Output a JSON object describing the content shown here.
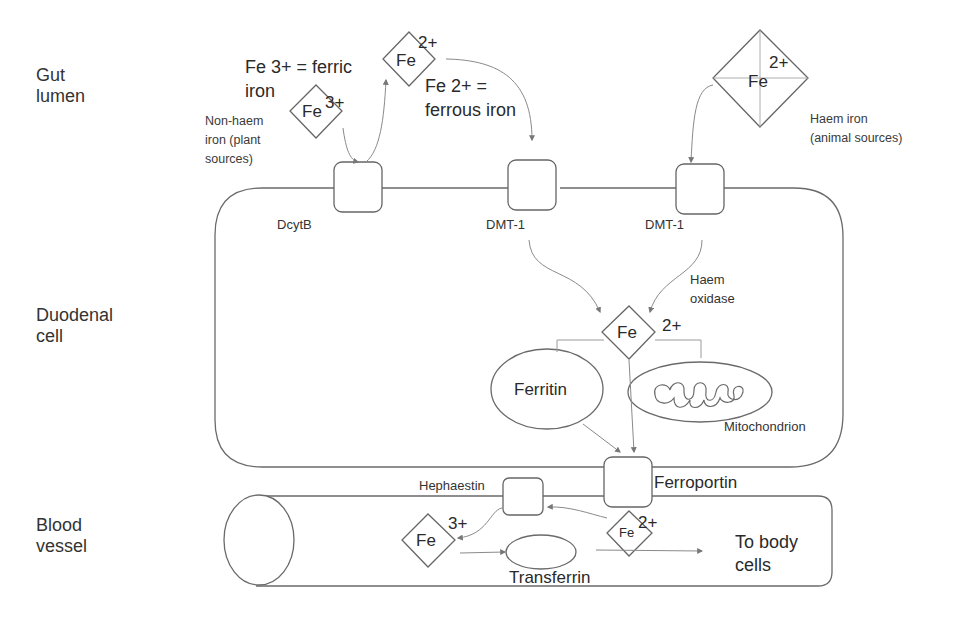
{
  "regions": {
    "gut_lumen": [
      "Gut",
      "lumen"
    ],
    "duodenal_cell": [
      "Duodenal",
      "cell"
    ],
    "blood_vessel": [
      "Blood",
      "vessel"
    ]
  },
  "definitions": {
    "ferric": [
      "Fe 3+ = ferric",
      "iron"
    ],
    "ferrous": [
      "Fe 2+ =",
      "ferrous iron"
    ]
  },
  "sources": {
    "non_haem": [
      "Non-haem",
      "iron (plant",
      "sources)"
    ],
    "haem": [
      "Haem iron",
      "(animal sources)"
    ]
  },
  "ions": {
    "fe3_lumen": {
      "symbol": "Fe",
      "charge": "3+"
    },
    "fe2_lumen": {
      "symbol": "Fe",
      "charge": "2+"
    },
    "haem_fe": {
      "symbol": "Fe",
      "charge": "2+"
    },
    "fe2_cell": {
      "symbol": "Fe",
      "charge": "2+"
    },
    "fe3_blood": {
      "symbol": "Fe",
      "charge": "3+"
    },
    "fe2_blood": {
      "symbol": "Fe",
      "charge": "2+"
    }
  },
  "transporters": {
    "dcytb": "DcytB",
    "dmt1_a": "DMT-1",
    "dmt1_b": "DMT-1",
    "ferroportin": "Ferroportin",
    "hephaestin": "Hephaestin"
  },
  "enzymes": {
    "haem_oxidase": [
      "Haem",
      "oxidase"
    ]
  },
  "organelles": {
    "ferritin": "Ferritin",
    "mitochondrion": "Mitochondrion",
    "transferrin": "Transferrin"
  },
  "destination": [
    "To body",
    "cells"
  ],
  "colors": {
    "line": "#6a6a6a",
    "arrow": "#8a8a8a",
    "text": "#2a2a2a"
  }
}
